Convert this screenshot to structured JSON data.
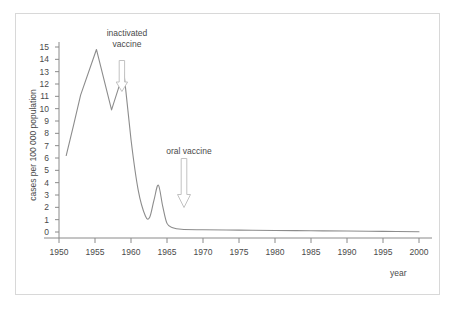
{
  "chart_data": {
    "type": "line",
    "title": "",
    "xlabel": "year",
    "ylabel": "cases per 100 000 population",
    "xlim": [
      1950,
      2000
    ],
    "ylim": [
      0,
      15
    ],
    "grid": false,
    "legend": "none",
    "x_ticks": [
      1950,
      1955,
      1960,
      1965,
      1970,
      1975,
      1980,
      1985,
      1990,
      1995,
      2000
    ],
    "y_ticks": [
      0,
      1,
      2,
      3,
      4,
      5,
      6,
      7,
      8,
      9,
      10,
      11,
      12,
      13,
      14,
      15
    ],
    "series": [
      {
        "name": "poliomyelitis incidence",
        "x": [
          1951.0,
          1952.0,
          1953.0,
          1955.2,
          1957.3,
          1959.0,
          1960.0,
          1961.0,
          1962.0,
          1962.6,
          1963.2,
          1963.8,
          1964.4,
          1965.0,
          1965.8,
          1967.0,
          1970.0,
          1975.0,
          1980.0,
          1985.0,
          1990.0,
          1995.0,
          2000.0
        ],
        "values": [
          6.2,
          8.6,
          11.1,
          14.8,
          9.9,
          13.0,
          7.5,
          3.4,
          1.3,
          1.2,
          2.6,
          3.8,
          2.1,
          0.7,
          0.35,
          0.22,
          0.18,
          0.15,
          0.12,
          0.1,
          0.08,
          0.05,
          0.02
        ]
      }
    ],
    "annotations": [
      {
        "name": "inactivated-vaccine",
        "label_line1": "inactivated",
        "label_line2": "vaccine",
        "arrow": "down",
        "points_to_year": 1959
      },
      {
        "name": "oral-vaccine",
        "label_line1": "oral vaccine",
        "label_line2": "",
        "arrow": "down",
        "points_to_year": 1967
      }
    ],
    "colors": {
      "line": "#8c8c8c",
      "axis": "#8a8a8a",
      "text": "#4a4a4a",
      "frame": "#d8d8d8",
      "annotation_arrow": "#bcbcbc",
      "background": "#ffffff"
    }
  },
  "axes": {
    "y_title": "cases per 100 000 population",
    "x_title": "year",
    "y_tick_labels": [
      "15",
      "14",
      "13",
      "12",
      "11",
      "10",
      "9",
      "8",
      "7",
      "6",
      "5",
      "4",
      "3",
      "2",
      "1",
      "0"
    ],
    "x_tick_labels": [
      "1950",
      "1955",
      "1960",
      "1965",
      "1970",
      "1975",
      "1980",
      "1985",
      "1990",
      "1995",
      "2000"
    ]
  },
  "annotations": {
    "inactivated": {
      "line1": "inactivated",
      "line2": "vaccine"
    },
    "oral": {
      "line1": "oral vaccine"
    }
  }
}
